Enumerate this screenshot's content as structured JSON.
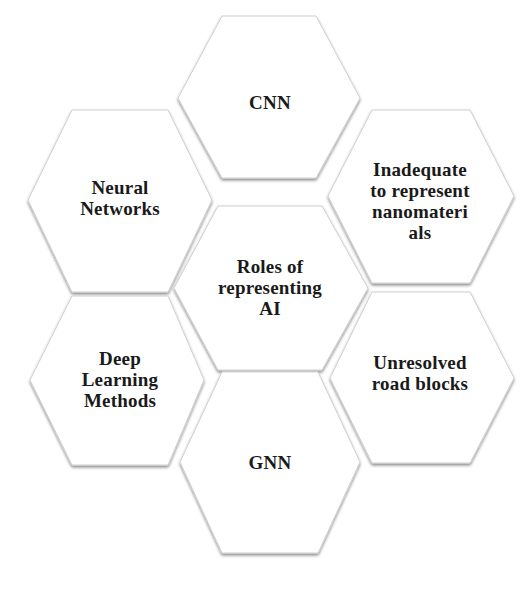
{
  "diagram": {
    "type": "hexagon-cluster",
    "center": {
      "label": "Roles of representing AI",
      "lines": [
        "Roles of",
        "representing",
        "AI"
      ]
    },
    "nodes": [
      {
        "id": "top",
        "label": "CNN",
        "lines": [
          "CNN"
        ]
      },
      {
        "id": "upper-right",
        "label": "Inadequate to represent nanomaterials",
        "lines": [
          "Inadequate",
          "to represent",
          "nanomateri",
          "als"
        ]
      },
      {
        "id": "lower-right",
        "label": "Unresolved road blocks",
        "lines": [
          "Unresolved",
          "road blocks"
        ]
      },
      {
        "id": "bottom",
        "label": "GNN",
        "lines": [
          "GNN"
        ]
      },
      {
        "id": "lower-left",
        "label": "Deep Learning Methods",
        "lines": [
          "Deep",
          "Learning",
          "Methods"
        ]
      },
      {
        "id": "upper-left",
        "label": "Neural Networks",
        "lines": [
          "Neural",
          "Networks"
        ]
      }
    ],
    "colors": {
      "fill": "#ffffff",
      "edge": "#b8b8b8",
      "text": "#1a1a1a"
    }
  }
}
